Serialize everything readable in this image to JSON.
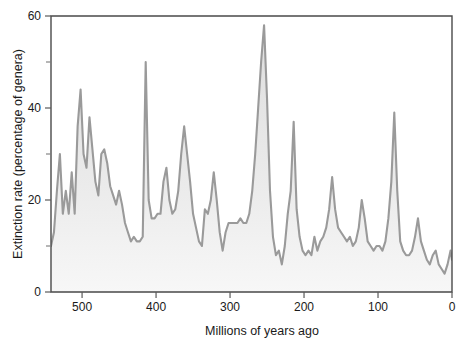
{
  "chart_data": {
    "type": "area",
    "title": "",
    "xlabel": "Millions of years ago",
    "ylabel": "Extinction rate (percentage of genera)",
    "xlim": [
      542,
      0
    ],
    "ylim": [
      0,
      60
    ],
    "x_reversed": true,
    "grid": false,
    "legend": null,
    "x_ticks": [
      500,
      400,
      300,
      200,
      100,
      0
    ],
    "x_tick_labels": [
      "500",
      "400",
      "300",
      "200",
      "100",
      "0"
    ],
    "y_ticks": [
      0,
      20,
      40,
      60
    ],
    "y_tick_labels": [
      "0",
      "20",
      "40",
      "60"
    ],
    "y_minor_ticks": [
      10,
      30,
      50
    ],
    "line_color": "#9a9a9a",
    "fill_color": "#e8e8e8",
    "axis_color": "#4a4a4a",
    "series": [
      {
        "name": "Extinction rate",
        "x": [
          542,
          538,
          534,
          530,
          526,
          522,
          518,
          514,
          510,
          506,
          502,
          498,
          494,
          490,
          486,
          482,
          478,
          474,
          470,
          466,
          462,
          458,
          454,
          450,
          446,
          442,
          438,
          434,
          430,
          426,
          422,
          418,
          414,
          410,
          406,
          402,
          398,
          394,
          390,
          386,
          382,
          378,
          374,
          370,
          366,
          362,
          358,
          354,
          350,
          346,
          342,
          338,
          334,
          330,
          326,
          322,
          318,
          314,
          310,
          306,
          302,
          298,
          294,
          290,
          286,
          282,
          278,
          274,
          270,
          266,
          262,
          258,
          254,
          250,
          246,
          242,
          238,
          234,
          230,
          226,
          222,
          218,
          214,
          210,
          206,
          202,
          198,
          194,
          190,
          186,
          182,
          178,
          174,
          170,
          166,
          162,
          158,
          154,
          150,
          146,
          142,
          138,
          134,
          130,
          126,
          122,
          118,
          114,
          110,
          106,
          102,
          98,
          94,
          90,
          86,
          82,
          78,
          74,
          70,
          66,
          62,
          58,
          54,
          50,
          46,
          42,
          38,
          34,
          30,
          26,
          22,
          18,
          14,
          10,
          6,
          2,
          0
        ],
        "y": [
          10,
          13,
          22,
          30,
          17,
          22,
          17,
          26,
          17,
          36,
          44,
          30,
          27,
          38,
          31,
          24,
          21,
          30,
          31,
          28,
          23,
          21,
          19,
          22,
          19,
          15,
          13,
          11,
          12,
          11,
          11,
          12,
          50,
          20,
          16,
          16,
          17,
          17,
          24,
          27,
          20,
          17,
          18,
          22,
          30,
          36,
          30,
          24,
          17,
          14,
          11,
          10,
          18,
          17,
          20,
          26,
          20,
          13,
          9,
          13,
          15,
          15,
          15,
          15,
          16,
          15,
          15,
          17,
          22,
          30,
          40,
          50,
          58,
          42,
          22,
          12,
          8,
          9,
          6,
          10,
          17,
          22,
          37,
          18,
          12,
          9,
          8,
          9,
          8,
          12,
          9,
          11,
          12,
          14,
          18,
          25,
          18,
          14,
          13,
          12,
          11,
          12,
          10,
          11,
          14,
          20,
          16,
          11,
          10,
          9,
          10,
          10,
          9,
          11,
          16,
          24,
          39,
          22,
          11,
          9,
          8,
          8,
          9,
          12,
          16,
          11,
          9,
          7,
          6,
          8,
          9,
          6,
          5,
          4,
          6,
          9,
          7
        ]
      }
    ]
  },
  "axes": {
    "y_label": "Extinction rate (percentage of genera)",
    "x_label": "Millions of years ago",
    "x_tick_labels": [
      "500",
      "400",
      "300",
      "200",
      "100",
      "0"
    ],
    "y_tick_labels": [
      "0",
      "20",
      "40",
      "60"
    ]
  }
}
